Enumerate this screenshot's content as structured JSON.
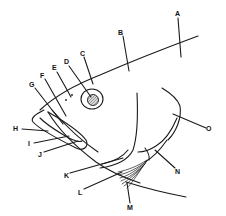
{
  "figure": {
    "labels": [
      {
        "id": "A",
        "text": "A"
      },
      {
        "id": "B",
        "text": "B"
      },
      {
        "id": "C",
        "text": "C"
      },
      {
        "id": "D",
        "text": "D"
      },
      {
        "id": "E",
        "text": "E"
      },
      {
        "id": "F",
        "text": "F"
      },
      {
        "id": "G",
        "text": "G"
      },
      {
        "id": "H",
        "text": "H"
      },
      {
        "id": "I",
        "text": "I"
      },
      {
        "id": "J",
        "text": "J"
      },
      {
        "id": "K",
        "text": "K"
      },
      {
        "id": "L",
        "text": "L"
      },
      {
        "id": "M",
        "text": "M"
      },
      {
        "id": "N",
        "text": "N"
      },
      {
        "id": "O",
        "text": "O"
      }
    ],
    "colors": {
      "line": "#1a1a1a",
      "background": "#ffffff"
    }
  }
}
